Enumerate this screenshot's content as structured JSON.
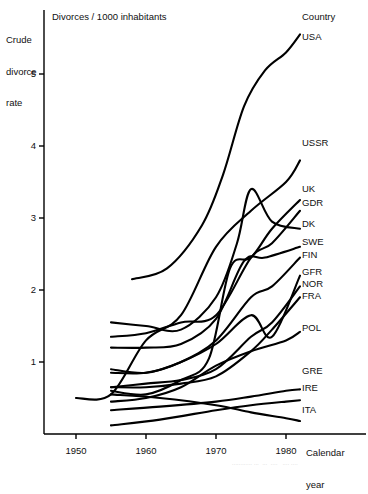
{
  "chart_data": {
    "type": "line",
    "title": "Divorces / 1000 inhabitants",
    "ylabel": "Crude divorce rate",
    "xlabel": "Calendar year",
    "xlim": [
      1946,
      1986
    ],
    "ylim": [
      0,
      5.7
    ],
    "grid": false,
    "legend": "right-side series end labels",
    "legend_header": "Country",
    "yticks": [
      "1",
      "2",
      "3",
      "4",
      "5"
    ],
    "ytick_values": [
      1,
      2,
      3,
      4,
      5
    ],
    "xticks": [
      "1950",
      "1960",
      "1970",
      "1980"
    ],
    "xtick_values": [
      1950,
      1960,
      1970,
      1980
    ],
    "series": [
      {
        "name": "USA",
        "x": [
          1958,
          1963,
          1968,
          1971,
          1974,
          1977,
          1980,
          1982
        ],
        "values": [
          2.15,
          2.3,
          2.9,
          3.6,
          4.55,
          5.05,
          5.3,
          5.55
        ]
      },
      {
        "name": "USSR",
        "x": [
          1950,
          1955,
          1960,
          1965,
          1970,
          1975,
          1980,
          1982
        ],
        "values": [
          0.5,
          0.55,
          1.3,
          1.65,
          2.6,
          3.1,
          3.5,
          3.8
        ]
      },
      {
        "name": "UK",
        "x": [
          1955,
          1960,
          1965,
          1969,
          1972,
          1975,
          1978,
          1982
        ],
        "values": [
          0.6,
          0.55,
          0.75,
          1.05,
          2.3,
          2.45,
          2.85,
          3.25
        ]
      },
      {
        "name": "GDR",
        "x": [
          1955,
          1960,
          1965,
          1970,
          1975,
          1978,
          1982
        ],
        "values": [
          1.35,
          1.4,
          1.55,
          1.65,
          2.45,
          2.65,
          3.1
        ]
      },
      {
        "name": "DK",
        "x": [
          1955,
          1960,
          1965,
          1970,
          1973,
          1975,
          1978,
          1982
        ],
        "values": [
          1.55,
          1.5,
          1.45,
          1.9,
          2.65,
          3.4,
          2.95,
          2.85
        ]
      },
      {
        "name": "SWE",
        "x": [
          1955,
          1960,
          1965,
          1970,
          1974,
          1977,
          1982
        ],
        "values": [
          1.2,
          1.2,
          1.25,
          1.6,
          2.4,
          2.45,
          2.6
        ]
      },
      {
        "name": "FIN",
        "x": [
          1955,
          1960,
          1965,
          1970,
          1975,
          1978,
          1982
        ],
        "values": [
          0.85,
          0.85,
          1.0,
          1.3,
          1.9,
          2.05,
          2.45
        ]
      },
      {
        "name": "GFR",
        "x": [
          1955,
          1960,
          1965,
          1970,
          1975,
          1978,
          1982
        ],
        "values": [
          0.9,
          0.85,
          1.0,
          1.25,
          1.65,
          1.35,
          2.2
        ]
      },
      {
        "name": "NOR",
        "x": [
          1955,
          1960,
          1965,
          1970,
          1975,
          1978,
          1982
        ],
        "values": [
          0.65,
          0.7,
          0.75,
          0.9,
          1.35,
          1.55,
          2.05
        ]
      },
      {
        "name": "FRA",
        "x": [
          1955,
          1960,
          1965,
          1970,
          1975,
          1978,
          1982
        ],
        "values": [
          0.65,
          0.65,
          0.7,
          0.8,
          1.15,
          1.45,
          1.9
        ]
      },
      {
        "name": "POL",
        "x": [
          1955,
          1960,
          1965,
          1970,
          1975,
          1980,
          1982
        ],
        "values": [
          0.45,
          0.5,
          0.65,
          0.95,
          1.15,
          1.3,
          1.42
        ]
      },
      {
        "name": "GRE",
        "x": [
          1955,
          1962,
          1970,
          1975,
          1980,
          1982
        ],
        "values": [
          0.33,
          0.38,
          0.45,
          0.52,
          0.6,
          0.62
        ]
      },
      {
        "name": "IRE",
        "x": [
          1955,
          1962,
          1970,
          1975,
          1980,
          1982
        ],
        "values": [
          0.12,
          0.2,
          0.33,
          0.4,
          0.45,
          0.47
        ]
      },
      {
        "name": "ITA",
        "x": [
          1955,
          1962,
          1970,
          1975,
          1980,
          1982
        ],
        "values": [
          0.55,
          0.5,
          0.4,
          0.3,
          0.22,
          0.18
        ]
      }
    ]
  },
  "axis": {
    "y_caption_line1": "Crude",
    "y_caption_line2": "divorce",
    "y_caption_line3": "rate",
    "x_caption_line1": "Calendar",
    "x_caption_line2": "year",
    "plot_title": "Divorces / 1000 inhabitants",
    "legend_title": "Country"
  },
  "footer": {
    "text": "............ ...  ...  ....   .... ...."
  }
}
